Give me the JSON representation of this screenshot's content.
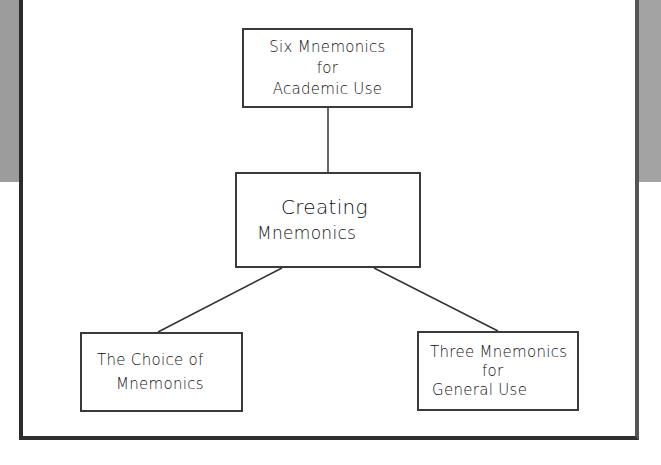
{
  "diagram": {
    "type": "hierarchy",
    "colors": {
      "background": "#ffffff",
      "band": "#9c9c9c",
      "frame_border": "#2b2b2b",
      "node_border": "#3a3a3a",
      "text": "#111111"
    },
    "center_node": {
      "lines": [
        "Creating",
        "Mnemonics"
      ]
    },
    "nodes": [
      {
        "position": "top",
        "lines": [
          "Six Mnemonics",
          "for",
          "Academic Use"
        ]
      },
      {
        "position": "bottom-left",
        "lines": [
          "The Choice of",
          "Mnemonics"
        ]
      },
      {
        "position": "bottom-right",
        "lines": [
          "Three Mnemonics",
          "for",
          "General Use"
        ]
      }
    ],
    "edges": [
      {
        "from": "Creating Mnemonics",
        "to": "Six Mnemonics for Academic Use"
      },
      {
        "from": "Creating Mnemonics",
        "to": "The Choice of Mnemonics"
      },
      {
        "from": "Creating Mnemonics",
        "to": "Three Mnemonics for General Use"
      }
    ]
  }
}
